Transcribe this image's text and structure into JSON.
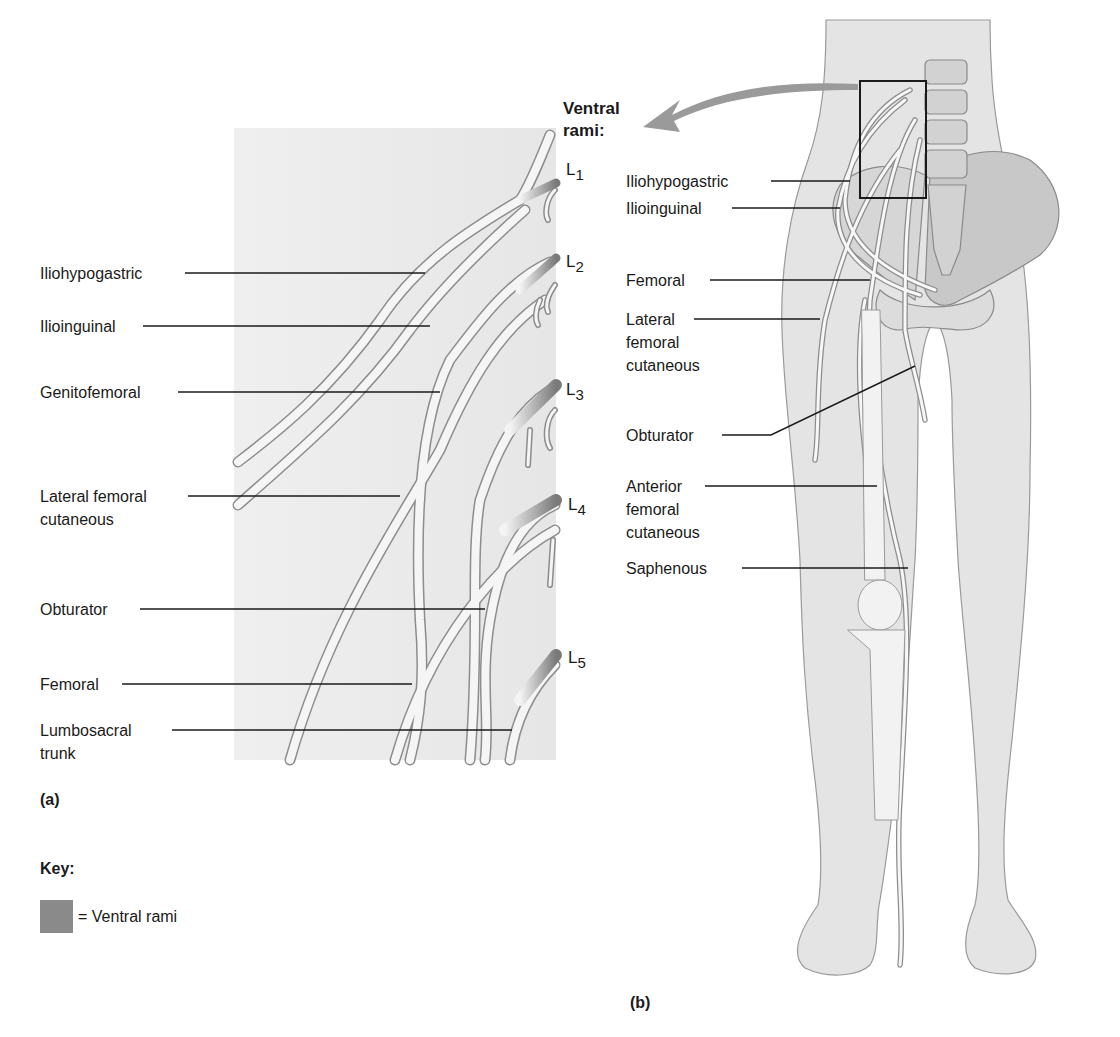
{
  "panel_a": {
    "caption": "(a)",
    "spinal_levels": [
      {
        "letter": "L",
        "sub": "1"
      },
      {
        "letter": "L",
        "sub": "2"
      },
      {
        "letter": "L",
        "sub": "3"
      },
      {
        "letter": "L",
        "sub": "4"
      },
      {
        "letter": "L",
        "sub": "5"
      }
    ],
    "labels": [
      {
        "text": "Iliohypogastric"
      },
      {
        "text": "Ilioinguinal"
      },
      {
        "text": "Genitofemoral"
      },
      {
        "text": "Lateral femoral",
        "text2": "cutaneous"
      },
      {
        "text": "Obturator"
      },
      {
        "text": "Femoral"
      },
      {
        "text": "Lumbosacral",
        "text2": "trunk"
      }
    ]
  },
  "panel_b": {
    "caption": "(b)",
    "heading_line1": "Ventral",
    "heading_line2": "rami:",
    "labels": [
      {
        "text": "Iliohypogastric"
      },
      {
        "text": "Ilioinguinal"
      },
      {
        "text": "Femoral"
      },
      {
        "text": "Lateral",
        "text2": "femoral",
        "text3": "cutaneous"
      },
      {
        "text": "Obturator"
      },
      {
        "text": "Anterior",
        "text2": "femoral",
        "text3": "cutaneous"
      },
      {
        "text": "Saphenous"
      }
    ]
  },
  "key": {
    "title": "Key:",
    "items": [
      {
        "swatch_color": "#8a8a8a",
        "label": "= Ventral rami"
      }
    ]
  },
  "colors": {
    "panel_bg": "#ececec",
    "body_fill": "#e4e4e4",
    "nerve_fill": "#f7f7f7",
    "nerve_stroke": "#8d8d8d",
    "leader_line": "#1a1a1a",
    "arrow": "#9a9a9a"
  }
}
